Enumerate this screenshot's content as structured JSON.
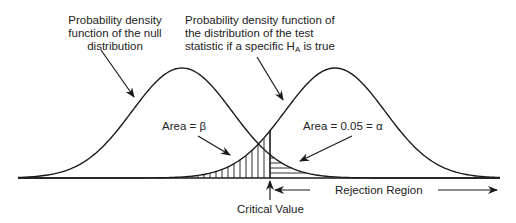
{
  "diagram": {
    "labels": {
      "null_pdf": [
        "Probability density",
        "function of the null",
        "distribution"
      ],
      "alt_pdf_line1": "Probability density function of",
      "alt_pdf_line2": "the distribution of the test",
      "alt_pdf_line3_pre": "statistic if a specific H",
      "alt_pdf_line3_sub": "A",
      "alt_pdf_line3_post": " is true",
      "area_beta": "Area = β",
      "area_alpha": "Area = 0.05 = α",
      "critical_value": "Critical Value",
      "rejection_region": "Rejection Region"
    },
    "geometry": {
      "baseline_y": 178,
      "x_start": 18,
      "x_end": 500,
      "null_mean_x": 182,
      "alt_mean_x": 335,
      "sigma_px": 50,
      "peak_height_px": 110,
      "critical_x": 270
    },
    "colors": {
      "stroke": "#1a1a1a",
      "text": "#222222",
      "background": "#ffffff"
    }
  }
}
